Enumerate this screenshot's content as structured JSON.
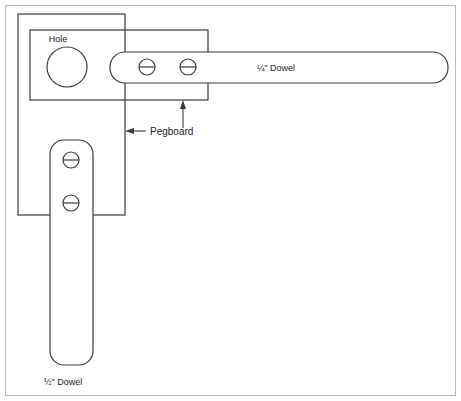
{
  "diagram": {
    "colors": {
      "line": "#3a3a3a",
      "frame": "#b9b9b9",
      "background": "#ffffff",
      "text": "#1c1c1c"
    },
    "labels": {
      "hole": "Hole",
      "pegboard": "Pegboard",
      "dowel_quarter": "¼\" Dowel",
      "dowel_half": "½\" Dowel"
    },
    "parts": {
      "pegboard_vertical": {
        "name": "pegboard-vertical-panel",
        "x": 18,
        "y": 14,
        "width": 107,
        "height": 201
      },
      "pegboard_horizontal": {
        "name": "pegboard-horizontal-panel",
        "x": 30,
        "y": 30,
        "width": 178,
        "height": 70
      },
      "hole": {
        "name": "mounting-hole",
        "cx": 67,
        "cy": 67,
        "r": 20
      },
      "dowel_quarter": {
        "name": "quarter-inch-dowel",
        "x": 110,
        "y": 52,
        "width": 338,
        "height": 31,
        "radius": 15,
        "label_x": 276,
        "label_y": 71
      },
      "dowel_half": {
        "name": "half-inch-dowel",
        "x": 50,
        "y": 140,
        "width": 43,
        "height": 225,
        "radius": 14,
        "label_x": 44,
        "label_y": 384
      }
    },
    "screws": [
      {
        "name": "screw-dowel-quarter-1",
        "cx": 147,
        "cy": 67,
        "r": 8
      },
      {
        "name": "screw-dowel-quarter-2",
        "cx": 188,
        "cy": 67,
        "r": 8
      },
      {
        "name": "screw-dowel-half-1",
        "cx": 71,
        "cy": 160,
        "r": 8
      },
      {
        "name": "screw-dowel-half-2",
        "cx": 71,
        "cy": 203,
        "r": 8
      }
    ],
    "callout": {
      "text_x": 150,
      "text_y": 136,
      "vertical_leader": {
        "x": 183,
        "y_top": 101,
        "y_bottom": 128
      },
      "horizontal_leader": {
        "y": 131,
        "x_left": 126,
        "x_right": 146
      }
    },
    "frame": {
      "x": 5,
      "y": 5,
      "width": 451,
      "height": 391
    }
  }
}
